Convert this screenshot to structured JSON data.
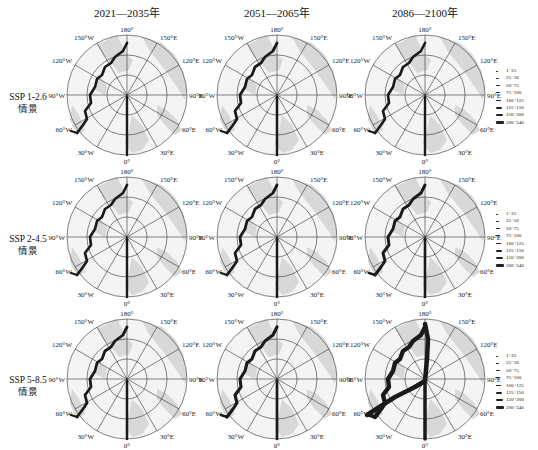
{
  "chart_data": {
    "type": "polar-map-grid",
    "title": "",
    "columns": [
      "2021—2035年",
      "2051—2065年",
      "2086—2100年"
    ],
    "rows": [
      {
        "label_line1": "SSP 1-2.6",
        "label_line2": "情景"
      },
      {
        "label_line1": "SSP 2-4.5",
        "label_line2": "情景"
      },
      {
        "label_line1": "SSP 5-8.5",
        "label_line2": "情景"
      }
    ],
    "angular_ticks": [
      "180°",
      "150°E",
      "120°E",
      "90°E",
      "60°E",
      "30°E",
      "0°",
      "30°W",
      "60°W",
      "90°W",
      "120°W",
      "150°W"
    ],
    "legend_classes": [
      "1~25",
      "25~50",
      "50~75",
      "75~100",
      "100~125",
      "125~150",
      "150~200",
      "200~240"
    ],
    "legend_position": "right of each row",
    "route_intensity_relative": [
      [
        0.45,
        0.5,
        0.45
      ],
      [
        0.45,
        0.5,
        0.55
      ],
      [
        0.5,
        0.6,
        1.0
      ]
    ]
  },
  "columns": [
    {
      "title": "2021—2035年"
    },
    {
      "title": "2051—2065年"
    },
    {
      "title": "2086—2100年"
    }
  ],
  "rows": [
    {
      "line1": "SSP 1-2.6",
      "line2": "情景"
    },
    {
      "line1": "SSP 2-4.5",
      "line2": "情景"
    },
    {
      "line1": "SSP 5-8.5",
      "line2": "情景"
    }
  ],
  "ticks": {
    "t180": "180°",
    "e150": "150°E",
    "e120": "120°E",
    "e90": "90°E",
    "e60": "60°E",
    "e30": "30°E",
    "t0": "0°",
    "w30": "30°W",
    "w60": "60°W",
    "w90": "90°W",
    "w120": "120°W",
    "w150": "150°W"
  },
  "legend": {
    "items": [
      "1~25",
      "25~50",
      "50~75",
      "75~100",
      "100~125",
      "125~150",
      "150~200",
      "200~240"
    ]
  },
  "colors": {
    "grid": "#333333",
    "land": "#d9d9d9",
    "route": "#1a1a1a"
  }
}
